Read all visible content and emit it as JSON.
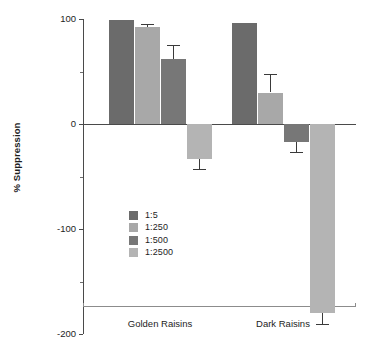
{
  "chart_data": {
    "type": "bar",
    "title": "",
    "xlabel": "",
    "ylabel": "% Suppression",
    "categories": [
      "Golden Raisins",
      "Dark Raisins"
    ],
    "ylim": [
      -200,
      100
    ],
    "yticks": [
      100,
      0,
      -100,
      -200
    ],
    "ytick_labels": [
      "100",
      "0",
      "-100",
      "-200"
    ],
    "yminor_ticks": [
      50,
      -50,
      -150
    ],
    "grid": false,
    "legend_position": "inside-lower-left",
    "series": [
      {
        "name": "1:5",
        "color": "#6b6b6b",
        "values": [
          99,
          96
        ],
        "errors": [
          0,
          0
        ]
      },
      {
        "name": "1:250",
        "color": "#a8a8a8",
        "values": [
          92,
          30
        ],
        "errors": [
          3,
          18
        ]
      },
      {
        "name": "1:500",
        "color": "#777777",
        "values": [
          62,
          -17
        ],
        "errors": [
          13,
          10
        ]
      },
      {
        "name": "1:2500",
        "color": "#b4b4b4",
        "values": [
          -33,
          -180
        ],
        "errors": [
          10,
          10
        ]
      }
    ]
  },
  "axis": {
    "ylabel": "% Suppression",
    "ytick_labels": [
      "100",
      "0",
      "-100",
      "-200"
    ],
    "xtick_labels": [
      "Golden Raisins",
      "Dark Raisins"
    ]
  },
  "legend": {
    "items": [
      {
        "label": "1:5",
        "color": "#6b6b6b"
      },
      {
        "label": "1:250",
        "color": "#a8a8a8"
      },
      {
        "label": "1:500",
        "color": "#777777"
      },
      {
        "label": "1:2500",
        "color": "#b4b4b4"
      }
    ]
  }
}
